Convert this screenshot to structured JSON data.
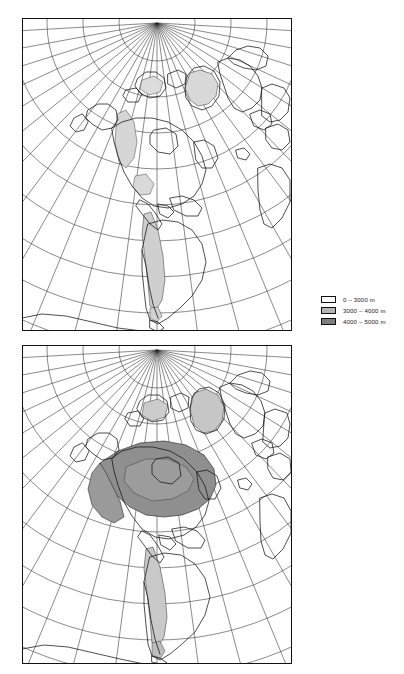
{
  "figure": {
    "background_color": "#ffffff",
    "line_color": "#111111",
    "width": 404,
    "height": 674
  },
  "legend": {
    "name": "elevation-legend",
    "items": [
      {
        "label": "0 – 3000 m",
        "swatch_color": "#ffffff",
        "swatch_border": "#111111",
        "range_min_m": 0,
        "range_max_m": 3000
      },
      {
        "label": "3000 – 4000 m",
        "swatch_color": "#b5b5b5",
        "swatch_border": "#111111",
        "range_min_m": 3000,
        "range_max_m": 4000
      },
      {
        "label": "4000 – 5000 m",
        "swatch_color": "#7d7d7d",
        "swatch_border": "#111111",
        "range_min_m": 4000,
        "range_max_m": 5000
      }
    ]
  },
  "panels": [
    {
      "name": "map-panel-top",
      "position": "top",
      "frame": {
        "x": 22,
        "y": 18,
        "width": 270,
        "height": 313
      },
      "projection": "polar-centered conic graticule",
      "pole_point": {
        "x": 135,
        "y": 5
      },
      "graticule": {
        "meridian_count": 25,
        "parallel_count": 9,
        "stroke": "#2a2a2a",
        "stroke_width": 0.55
      },
      "shaded_regions": [
        {
          "region": "greenland-highlands",
          "fill": "#d0d0d0"
        },
        {
          "region": "andes-cordillera",
          "fill": "#cfcfcf"
        },
        {
          "region": "north-american-cordillera",
          "fill": "#d4d4d4"
        }
      ]
    },
    {
      "name": "map-panel-bottom",
      "position": "bottom",
      "frame": {
        "x": 22,
        "y": 345,
        "width": 270,
        "height": 319
      },
      "projection": "polar-centered conic graticule",
      "pole_point": {
        "x": 135,
        "y": 5
      },
      "graticule": {
        "meridian_count": 25,
        "parallel_count": 9,
        "stroke": "#2a2a2a",
        "stroke_width": 0.55
      },
      "shaded_regions": [
        {
          "region": "laurentide-ice-sheet",
          "fill": "#8f8f8f"
        },
        {
          "region": "greenland-ice-sheet",
          "fill": "#c6c6c6"
        },
        {
          "region": "andes-cordillera",
          "fill": "#c9c9c9"
        },
        {
          "region": "patagonian-ice-field",
          "fill": "#bdbdbd"
        }
      ]
    }
  ]
}
